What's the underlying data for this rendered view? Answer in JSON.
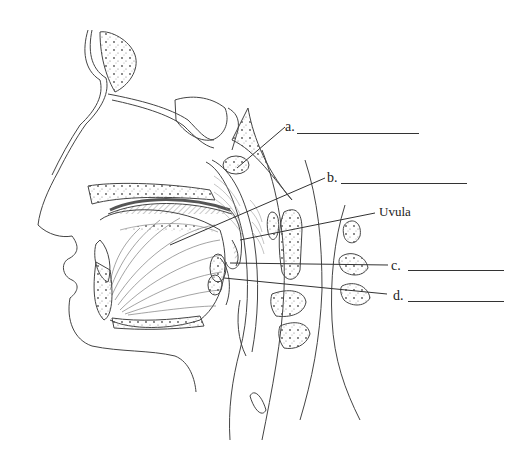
{
  "diagram": {
    "type": "anatomical-labeling-worksheet",
    "colors": {
      "background": "#ffffff",
      "ink": "#333333",
      "hatching": "#888888"
    }
  },
  "labels": [
    {
      "id": "a",
      "text": "a.",
      "blank": true
    },
    {
      "id": "b",
      "text": "b.",
      "blank": true
    },
    {
      "id": "uvula",
      "text": "Uvula",
      "blank": false
    },
    {
      "id": "c",
      "text": "c.",
      "blank": true
    },
    {
      "id": "d",
      "text": "d.",
      "blank": true
    }
  ]
}
